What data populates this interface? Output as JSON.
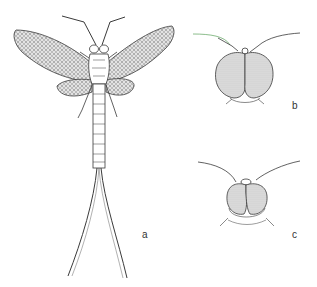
{
  "figure": {
    "panels": [
      {
        "id": "a",
        "label": "a",
        "description": "whole adult mayfly, dorsal view with wings spread and two long cerci"
      },
      {
        "id": "b",
        "label": "b",
        "description": "head, frontal view with large contiguous compound eyes"
      },
      {
        "id": "c",
        "label": "c",
        "description": "head, frontal view with smaller compound eyes"
      }
    ]
  },
  "colors": {
    "line": "#3a3a3a",
    "eye_fill": "#d9d9d9",
    "wing_fill": "#c8c8c8",
    "background": "#ffffff",
    "label": "#333333"
  }
}
